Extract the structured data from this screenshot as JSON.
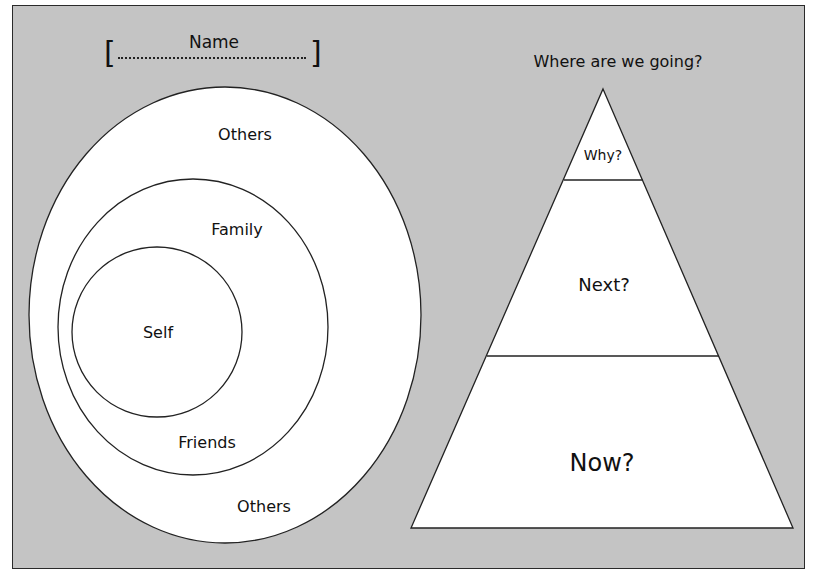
{
  "name_field": {
    "label": "Name",
    "open_bracket": "[",
    "close_bracket": "]"
  },
  "circles": {
    "outer_top_label": "Others",
    "outer_bottom_label": "Others",
    "middle_top_label": "Family",
    "middle_bottom_label": "Friends",
    "inner_label": "Self"
  },
  "pyramid": {
    "title": "Where are we going?",
    "tiers": [
      {
        "label": "Why?"
      },
      {
        "label": "Next?"
      },
      {
        "label": "Now?"
      }
    ]
  },
  "colors": {
    "background": "#c4c4c4",
    "shape_fill": "#ffffff",
    "stroke": "#222222",
    "text": "#111111"
  }
}
